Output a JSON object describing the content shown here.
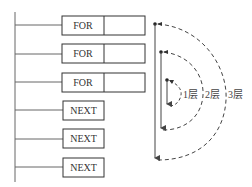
{
  "diagram": {
    "for_boxes": [
      {
        "label": "FOR"
      },
      {
        "label": "FOR"
      },
      {
        "label": "FOR"
      }
    ],
    "next_boxes": [
      {
        "label": "NEXT"
      },
      {
        "label": "NEXT"
      },
      {
        "label": "NEXT"
      }
    ],
    "layers": [
      {
        "label": "1层"
      },
      {
        "label": "2层"
      },
      {
        "label": "3层"
      }
    ],
    "colors": {
      "line": "#555555",
      "box_border": "#333333",
      "dashed": "#444444"
    }
  }
}
